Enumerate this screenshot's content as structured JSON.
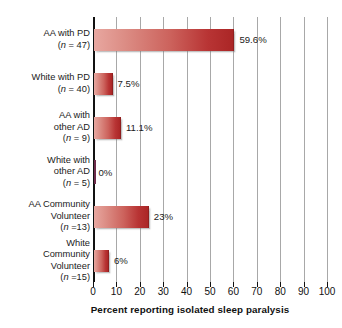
{
  "chart_data": {
    "type": "bar",
    "orientation": "horizontal",
    "title": "",
    "xlabel": "Percent reporting isolated sleep paralysis",
    "ylabel": "",
    "xlim": [
      0,
      100
    ],
    "xticks": [
      0,
      10,
      20,
      30,
      40,
      50,
      60,
      70,
      80,
      90,
      100
    ],
    "xtick_labels": [
      "0",
      "10",
      "20",
      "30",
      "40",
      "50",
      "60",
      "70",
      "80",
      "90",
      "100"
    ],
    "grid": "vertical",
    "legend": "none",
    "categories": [
      "AA with PD (n = 47)",
      "White with PD (n = 40)",
      "AA with other AD (n = 9)",
      "White with other AD (n = 5)",
      "AA Community Volunteer (n =13)",
      "White Community Volunteer (n =15)"
    ],
    "values": [
      59.6,
      7.5,
      11.1,
      0,
      23,
      6
    ],
    "value_labels": [
      "59.6%",
      "7.5%",
      "11.1%",
      "0%",
      "23%",
      "6%"
    ],
    "bar_color_light": "#e8a7a0",
    "bar_color_dark": "#ab2626",
    "background": "#ffffff"
  },
  "rows": [
    {
      "label_lines": [
        "AA with PD"
      ],
      "n_prefix": "(",
      "n_italic": "n",
      "n_suffix": " = 47)",
      "value": 59.6,
      "value_label": "59.6%"
    },
    {
      "label_lines": [
        "White with PD"
      ],
      "n_prefix": "(",
      "n_italic": "n",
      "n_suffix": " = 40)",
      "value": 7.5,
      "value_label": "7.5%"
    },
    {
      "label_lines": [
        "AA with",
        "other AD"
      ],
      "n_prefix": "(",
      "n_italic": "n",
      "n_suffix": " = 9)",
      "value": 11.1,
      "value_label": "11.1%"
    },
    {
      "label_lines": [
        "White with",
        "other AD"
      ],
      "n_prefix": "(",
      "n_italic": "n",
      "n_suffix": " = 5)",
      "value": 0,
      "value_label": "0%"
    },
    {
      "label_lines": [
        "AA Community",
        "Volunteer"
      ],
      "n_prefix": "(",
      "n_italic": "n",
      "n_suffix": " =13)",
      "value": 23,
      "value_label": "23%"
    },
    {
      "label_lines": [
        "White",
        "Community",
        "Volunteer"
      ],
      "n_prefix": "(",
      "n_italic": "n",
      "n_suffix": " =15)",
      "value": 6,
      "value_label": "6%"
    }
  ],
  "axis": {
    "title": "Percent reporting isolated sleep paralysis"
  }
}
